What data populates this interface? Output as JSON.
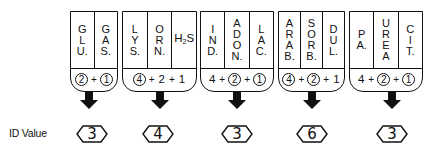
{
  "id_label": "ID Value",
  "groups": [
    {
      "tests": [
        {
          "chars": [
            "G",
            "L",
            "U."
          ]
        },
        {
          "chars": [
            "G",
            "A",
            "S."
          ]
        }
      ],
      "formula": [
        {
          "v": "2",
          "circled": true
        },
        {
          "op": "+"
        },
        {
          "v": "1",
          "circled": true
        }
      ],
      "id_value": "3"
    },
    {
      "tests": [
        {
          "chars": [
            "L",
            "Y",
            "S."
          ]
        },
        {
          "chars": [
            "O",
            "R",
            "N."
          ]
        },
        {
          "inline": "H",
          "sub": "2",
          "after": "S"
        }
      ],
      "formula": [
        {
          "v": "4",
          "circled": true
        },
        {
          "op": "+"
        },
        {
          "v": "2",
          "circled": false
        },
        {
          "op": "+"
        },
        {
          "v": "1",
          "circled": false
        }
      ],
      "id_value": "4"
    },
    {
      "tests": [
        {
          "chars": [
            "I",
            "N",
            "D."
          ]
        },
        {
          "chars": [
            "A",
            "D",
            "O",
            "N."
          ]
        },
        {
          "chars": [
            "L",
            "A",
            "C."
          ]
        }
      ],
      "formula": [
        {
          "v": "4",
          "circled": false
        },
        {
          "op": "+"
        },
        {
          "v": "2",
          "circled": true
        },
        {
          "op": "+"
        },
        {
          "v": "1",
          "circled": true
        }
      ],
      "id_value": "3"
    },
    {
      "tests": [
        {
          "chars": [
            "A",
            "R",
            "A",
            "B."
          ]
        },
        {
          "chars": [
            "S",
            "O",
            "R",
            "B."
          ]
        },
        {
          "chars": [
            "D",
            "U",
            "L."
          ]
        }
      ],
      "formula": [
        {
          "v": "4",
          "circled": true
        },
        {
          "op": "+"
        },
        {
          "v": "2",
          "circled": true
        },
        {
          "op": "+"
        },
        {
          "v": "1",
          "circled": false
        }
      ],
      "id_value": "6"
    },
    {
      "tests": [
        {
          "chars": [
            "P",
            "A."
          ]
        },
        {
          "chars": [
            "U",
            "R",
            "E",
            "A"
          ]
        },
        {
          "chars": [
            "C",
            "I",
            "T."
          ]
        }
      ],
      "formula": [
        {
          "v": "4",
          "circled": false
        },
        {
          "op": "+"
        },
        {
          "v": "2",
          "circled": true
        },
        {
          "op": "+"
        },
        {
          "v": "1",
          "circled": true
        }
      ],
      "id_value": "3"
    }
  ],
  "layout": {
    "groups_x": [
      [
        70,
        118
      ],
      [
        122,
        197
      ],
      [
        200,
        274
      ],
      [
        278,
        345
      ],
      [
        349,
        423
      ]
    ],
    "arrow_cx": [
      89,
      160,
      237,
      312,
      392
    ],
    "hex_cx": [
      92,
      158,
      237,
      312,
      392
    ]
  }
}
